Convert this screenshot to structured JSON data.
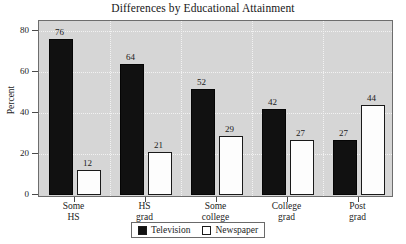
{
  "chart_data": {
    "type": "bar",
    "title": "Differences by Educational Attainment",
    "xlabel": "",
    "ylabel": "Percent",
    "ylim": [
      0,
      85
    ],
    "yticks": [
      0,
      20,
      40,
      60,
      80
    ],
    "grid": true,
    "legend_position": "bottom-center",
    "categories": [
      {
        "line1": "Some",
        "line2": "HS"
      },
      {
        "line1": "HS",
        "line2": "grad"
      },
      {
        "line1": "Some",
        "line2": "college"
      },
      {
        "line1": "College",
        "line2": "grad"
      },
      {
        "line1": "Post",
        "line2": "grad"
      }
    ],
    "series": [
      {
        "name": "Television",
        "color": "#111111",
        "values": [
          76,
          64,
          52,
          42,
          27
        ]
      },
      {
        "name": "Newspaper",
        "color": "#ffffff",
        "values": [
          12,
          21,
          29,
          27,
          44
        ]
      }
    ]
  },
  "colors": {
    "plot_background": "#d6d6d6",
    "page_background": "#ffffff",
    "gridline": "#f2f2f2",
    "axis": "#6d6d6d",
    "television": "#111111",
    "newspaper": "#ffffff",
    "text": "#1a1a1a"
  }
}
